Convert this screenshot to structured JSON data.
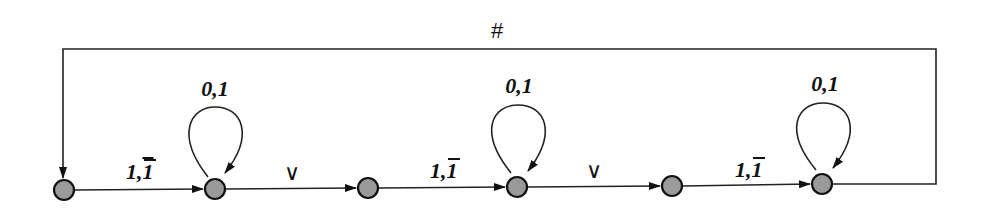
{
  "diagram": {
    "type": "finite-automaton",
    "states": [
      {
        "id": "s1",
        "cx": 64,
        "cy": 190
      },
      {
        "id": "s2",
        "cx": 215,
        "cy": 189
      },
      {
        "id": "s3",
        "cx": 368,
        "cy": 188
      },
      {
        "id": "s4",
        "cx": 517,
        "cy": 187
      },
      {
        "id": "s5",
        "cx": 672,
        "cy": 186
      },
      {
        "id": "s6",
        "cx": 822,
        "cy": 184
      }
    ],
    "state_fill": "#9a9a9a",
    "edges": [
      {
        "from": "s1",
        "to": "s2",
        "label_main": "1,",
        "label_bar": "1"
      },
      {
        "from": "s2",
        "to": "s3",
        "label": "∨"
      },
      {
        "from": "s3",
        "to": "s4",
        "label_main": "1,",
        "label_bar": "1"
      },
      {
        "from": "s4",
        "to": "s5",
        "label": "∨"
      },
      {
        "from": "s5",
        "to": "s6",
        "label_main": "1,",
        "label_bar": "1"
      },
      {
        "from": "s6",
        "to": "s1",
        "label": "#",
        "kind": "feedback"
      }
    ],
    "self_loops": [
      {
        "state": "s2",
        "label": "0,1"
      },
      {
        "state": "s4",
        "label": "0,1"
      },
      {
        "state": "s6",
        "label": "0,1"
      }
    ]
  }
}
